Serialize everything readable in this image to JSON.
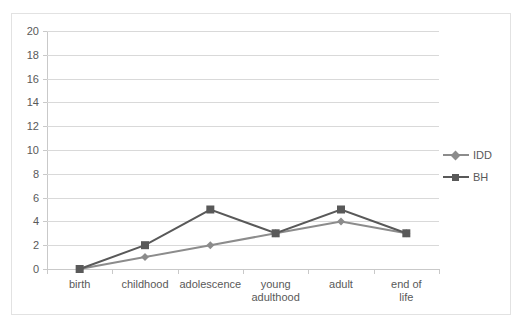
{
  "chart_data": {
    "type": "line",
    "title": "",
    "xlabel": "",
    "ylabel": "",
    "categories": [
      "birth",
      "childhood",
      "adolescence",
      "young\nadulthood",
      "adult",
      "end of life"
    ],
    "ylim": [
      0,
      20
    ],
    "ytick_step": 2,
    "yticks": [
      0,
      2,
      4,
      6,
      8,
      10,
      12,
      14,
      16,
      18,
      20
    ],
    "grid": true,
    "legend_position": "right",
    "series": [
      {
        "name": "IDD",
        "values": [
          0,
          1,
          2,
          3,
          4,
          3
        ],
        "color": "#8c8c8c",
        "marker": "diamond"
      },
      {
        "name": "BH",
        "values": [
          0,
          2,
          5,
          3,
          5,
          3
        ],
        "color": "#595959",
        "marker": "square"
      }
    ]
  },
  "legend": {
    "items": [
      {
        "label": "IDD"
      },
      {
        "label": "BH"
      }
    ]
  },
  "colors": {
    "idd": "#8c8c8c",
    "bh": "#595959",
    "gridline": "#d9d9d9",
    "axis": "#c9c9c9",
    "text": "#595959",
    "border": "#e2e2e2",
    "background": "#ffffff"
  }
}
